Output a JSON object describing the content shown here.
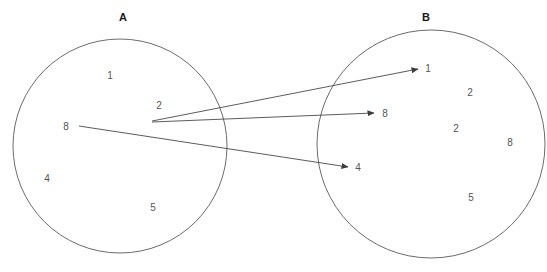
{
  "diagram": {
    "type": "venn-mapping",
    "background_color": "#ffffff",
    "stroke_color": "#5a5a5a",
    "text_color": "#555555",
    "title_color": "#1a1a1a",
    "sets": [
      {
        "id": "A",
        "label": "A",
        "label_x": 123,
        "label_y": 17,
        "cx": 120,
        "cy": 146,
        "r": 107,
        "elements": [
          {
            "value": "1",
            "x": 110,
            "y": 75
          },
          {
            "value": "2",
            "x": 159,
            "y": 105
          },
          {
            "value": "8",
            "x": 66,
            "y": 126
          },
          {
            "value": "4",
            "x": 47,
            "y": 178
          },
          {
            "value": "5",
            "x": 153,
            "y": 207
          }
        ]
      },
      {
        "id": "B",
        "label": "B",
        "label_x": 426,
        "label_y": 17,
        "cx": 431,
        "cy": 144,
        "r": 114,
        "elements": [
          {
            "value": "1",
            "x": 428,
            "y": 68
          },
          {
            "value": "2",
            "x": 470,
            "y": 92
          },
          {
            "value": "8",
            "x": 385,
            "y": 113
          },
          {
            "value": "2",
            "x": 456,
            "y": 128
          },
          {
            "value": "8",
            "x": 510,
            "y": 142
          },
          {
            "value": "4",
            "x": 358,
            "y": 167
          },
          {
            "value": "5",
            "x": 471,
            "y": 197
          }
        ]
      }
    ],
    "arrows": [
      {
        "name": "arrow-2-to-1",
        "from_x": 152,
        "from_y": 121,
        "to_x": 418,
        "to_y": 69
      },
      {
        "name": "arrow-2-to-8",
        "from_x": 152,
        "from_y": 122,
        "to_x": 374,
        "to_y": 113
      },
      {
        "name": "arrow-8-to-4",
        "from_x": 79,
        "from_y": 126,
        "to_x": 348,
        "to_y": 167
      }
    ]
  }
}
